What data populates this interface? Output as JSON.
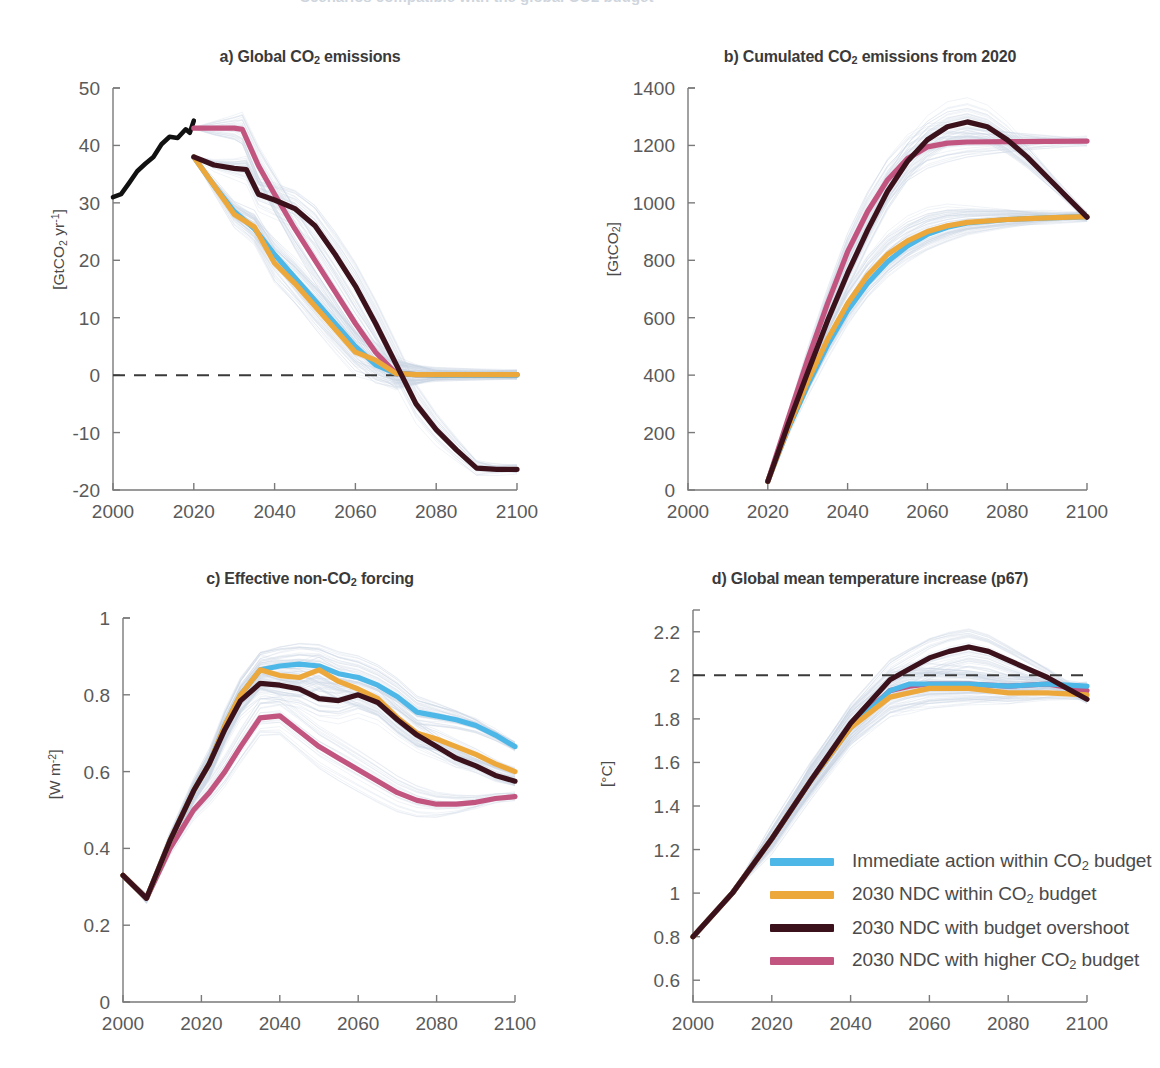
{
  "figure": {
    "background": "#ffffff",
    "cut_off_header": "Scenarios compatible with the global CO2 budget"
  },
  "colors": {
    "immediate": "#4DB7E8",
    "ndc_within": "#EDA83C",
    "ndc_overshoot": "#3B121C",
    "ndc_higher": "#C15580",
    "historical": "#111111",
    "ensemble": "#c9d4e2",
    "axis": "#7a7a7a",
    "text": "#4a4a4a"
  },
  "legend": {
    "position": "inside panel d, lower right",
    "entries": [
      {
        "label": "Immediate action within CO2 budget",
        "label_html": "Immediate action within CO<sub>2</sub> budget",
        "color_key": "immediate"
      },
      {
        "label": "2030 NDC within CO2 budget",
        "label_html": "2030 NDC within CO<sub>2</sub> budget",
        "color_key": "ndc_within"
      },
      {
        "label": "2030 NDC with budget overshoot",
        "label_html": "2030 NDC with budget overshoot",
        "color_key": "ndc_overshoot"
      },
      {
        "label": "2030 NDC with higher CO2 budget",
        "label_html": "2030 NDC with higher CO<sub>2</sub> budget",
        "color_key": "ndc_higher"
      }
    ]
  },
  "chart_data": [
    {
      "id": "a",
      "type": "line",
      "title": "a) Global CO2 emissions",
      "title_html": "a) Global CO<sub>2</sub> emissions",
      "xlabel": "",
      "ylabel": "[GtCO2 yr-1]",
      "ylabel_html": "[GtCO<sub>2</sub> yr<sup>-1</sup>]",
      "xlim": [
        2000,
        2100
      ],
      "ylim": [
        -20,
        50
      ],
      "xticks": [
        2000,
        2020,
        2040,
        2060,
        2080,
        2100
      ],
      "yticks": [
        -20,
        -10,
        0,
        10,
        20,
        30,
        40,
        50
      ],
      "grid": false,
      "hline": 0,
      "hline_style": "dashed",
      "historical": {
        "name": "Historical emissions",
        "x": [
          2000,
          2002,
          2004,
          2006,
          2008,
          2010,
          2012,
          2014,
          2016,
          2018,
          2019,
          2020
        ],
        "y": [
          31.0,
          31.5,
          33.5,
          35.5,
          36.8,
          38.0,
          40.2,
          41.5,
          41.3,
          42.8,
          42.2,
          44.3
        ]
      },
      "series": [
        {
          "name": "Immediate action within CO2 budget",
          "color_key": "immediate",
          "x": [
            2020,
            2025,
            2030,
            2035,
            2040,
            2045,
            2050,
            2055,
            2060,
            2065,
            2070,
            2075,
            2080,
            2100
          ],
          "y": [
            38.0,
            33.0,
            28.5,
            25.5,
            21.0,
            17.0,
            13.0,
            9.0,
            5.0,
            1.8,
            0.3,
            0.1,
            0.0,
            0.0
          ]
        },
        {
          "name": "2030 NDC within CO2 budget",
          "color_key": "ndc_within",
          "x": [
            2020,
            2025,
            2030,
            2035,
            2040,
            2045,
            2050,
            2055,
            2060,
            2065,
            2070,
            2075,
            2080,
            2100
          ],
          "y": [
            38.0,
            33.0,
            28.0,
            25.8,
            19.5,
            16.0,
            12.0,
            8.0,
            4.0,
            2.6,
            0.3,
            0.1,
            0.1,
            0.1
          ]
        },
        {
          "name": "2030 NDC with budget overshoot",
          "color_key": "ndc_overshoot",
          "x": [
            2020,
            2025,
            2030,
            2033,
            2036,
            2040,
            2045,
            2050,
            2055,
            2060,
            2065,
            2070,
            2075,
            2080,
            2085,
            2090,
            2095,
            2100
          ],
          "y": [
            38.0,
            36.6,
            36.0,
            35.8,
            31.5,
            30.5,
            29.0,
            26.0,
            21.0,
            15.5,
            9.0,
            2.0,
            -5.0,
            -9.5,
            -13.0,
            -16.2,
            -16.4,
            -16.4
          ]
        },
        {
          "name": "2030 NDC with higher CO2 budget",
          "color_key": "ndc_higher",
          "x": [
            2020,
            2025,
            2030,
            2032,
            2036,
            2040,
            2045,
            2050,
            2055,
            2060,
            2065,
            2070,
            2075,
            2080,
            2100
          ],
          "y": [
            43.0,
            43.0,
            43.0,
            42.8,
            36.5,
            31.5,
            25.5,
            20.0,
            14.5,
            9.0,
            4.0,
            0.3,
            0.1,
            0.1,
            0.1
          ]
        }
      ]
    },
    {
      "id": "b",
      "type": "line",
      "title": "b) Cumulated CO2 emissions from 2020",
      "title_html": "b) Cumulated CO<sub>2</sub> emissions from 2020",
      "xlabel": "",
      "ylabel": "[GtCO2]",
      "ylabel_html": "[GtCO<sub>2</sub>]",
      "xlim": [
        2000,
        2100
      ],
      "ylim": [
        0,
        1400
      ],
      "xticks": [
        2000,
        2020,
        2040,
        2060,
        2080,
        2100
      ],
      "yticks": [
        0,
        200,
        400,
        600,
        800,
        1000,
        1200,
        1400
      ],
      "grid": false,
      "series": [
        {
          "name": "Immediate action within CO2 budget",
          "color_key": "immediate",
          "x": [
            2020,
            2025,
            2030,
            2035,
            2040,
            2045,
            2050,
            2055,
            2060,
            2065,
            2070,
            2080,
            2090,
            2100
          ],
          "y": [
            30,
            210,
            365,
            505,
            625,
            720,
            795,
            850,
            890,
            915,
            930,
            942,
            948,
            952
          ]
        },
        {
          "name": "2030 NDC within CO2 budget",
          "color_key": "ndc_within",
          "x": [
            2020,
            2025,
            2030,
            2035,
            2040,
            2045,
            2050,
            2055,
            2060,
            2065,
            2070,
            2080,
            2090,
            2100
          ],
          "y": [
            30,
            215,
            380,
            525,
            650,
            748,
            820,
            868,
            900,
            920,
            932,
            942,
            948,
            952
          ]
        },
        {
          "name": "2030 NDC with budget overshoot",
          "color_key": "ndc_overshoot",
          "x": [
            2020,
            2025,
            2030,
            2035,
            2040,
            2045,
            2050,
            2055,
            2060,
            2065,
            2070,
            2075,
            2080,
            2085,
            2090,
            2095,
            2100
          ],
          "y": [
            30,
            225,
            410,
            590,
            755,
            905,
            1040,
            1145,
            1220,
            1265,
            1282,
            1265,
            1220,
            1160,
            1090,
            1020,
            950
          ]
        },
        {
          "name": "2030 NDC with higher CO2 budget",
          "color_key": "ndc_higher",
          "x": [
            2020,
            2025,
            2030,
            2035,
            2040,
            2045,
            2050,
            2055,
            2060,
            2065,
            2070,
            2080,
            2090,
            2100
          ],
          "y": [
            30,
            245,
            455,
            650,
            830,
            970,
            1080,
            1155,
            1195,
            1208,
            1212,
            1213,
            1214,
            1215
          ]
        }
      ]
    },
    {
      "id": "c",
      "type": "line",
      "title": "c) Effective non-CO2 forcing",
      "title_html": "c) Effective non-CO<sub>2</sub> forcing",
      "xlabel": "",
      "ylabel": "[W m-2]",
      "ylabel_html": "[W m<sup>-2</sup>]",
      "xlim": [
        2000,
        2100
      ],
      "ylim": [
        0,
        1
      ],
      "xticks": [
        2000,
        2020,
        2040,
        2060,
        2080,
        2100
      ],
      "yticks": [
        0,
        0.2,
        0.4,
        0.6,
        0.8,
        1
      ],
      "grid": false,
      "series": [
        {
          "name": "Immediate action within CO2 budget",
          "color_key": "immediate",
          "x": [
            2000,
            2006,
            2012,
            2018,
            2022,
            2026,
            2030,
            2035,
            2040,
            2045,
            2050,
            2055,
            2060,
            2065,
            2070,
            2075,
            2080,
            2085,
            2090,
            2095,
            2100
          ],
          "y": [
            0.33,
            0.27,
            0.42,
            0.55,
            0.62,
            0.72,
            0.8,
            0.865,
            0.875,
            0.88,
            0.875,
            0.855,
            0.845,
            0.825,
            0.795,
            0.755,
            0.745,
            0.735,
            0.72,
            0.695,
            0.665
          ]
        },
        {
          "name": "2030 NDC within CO2 budget",
          "color_key": "ndc_within",
          "x": [
            2000,
            2006,
            2012,
            2018,
            2022,
            2026,
            2030,
            2035,
            2040,
            2045,
            2050,
            2055,
            2060,
            2065,
            2070,
            2075,
            2080,
            2085,
            2090,
            2095,
            2100
          ],
          "y": [
            0.33,
            0.27,
            0.42,
            0.55,
            0.62,
            0.72,
            0.8,
            0.865,
            0.85,
            0.845,
            0.865,
            0.835,
            0.815,
            0.79,
            0.74,
            0.7,
            0.685,
            0.665,
            0.645,
            0.62,
            0.6
          ]
        },
        {
          "name": "2030 NDC with budget overshoot",
          "color_key": "ndc_overshoot",
          "x": [
            2000,
            2006,
            2012,
            2018,
            2022,
            2026,
            2030,
            2035,
            2040,
            2045,
            2050,
            2055,
            2060,
            2065,
            2070,
            2075,
            2080,
            2085,
            2090,
            2095,
            2100
          ],
          "y": [
            0.33,
            0.27,
            0.42,
            0.55,
            0.62,
            0.71,
            0.785,
            0.83,
            0.825,
            0.815,
            0.79,
            0.785,
            0.8,
            0.78,
            0.735,
            0.695,
            0.665,
            0.635,
            0.615,
            0.59,
            0.575
          ]
        },
        {
          "name": "2030 NDC with higher CO2 budget",
          "color_key": "ndc_higher",
          "x": [
            2000,
            2006,
            2012,
            2018,
            2022,
            2026,
            2030,
            2035,
            2040,
            2045,
            2050,
            2055,
            2060,
            2065,
            2070,
            2075,
            2080,
            2085,
            2090,
            2095,
            2100
          ],
          "y": [
            0.33,
            0.27,
            0.4,
            0.5,
            0.545,
            0.6,
            0.665,
            0.74,
            0.745,
            0.705,
            0.665,
            0.635,
            0.605,
            0.575,
            0.545,
            0.525,
            0.515,
            0.515,
            0.52,
            0.53,
            0.535
          ]
        }
      ]
    },
    {
      "id": "d",
      "type": "line",
      "title": "d) Global mean temperature increase (p67)",
      "title_html": "d) Global mean temperature increase (p67)",
      "xlabel": "",
      "ylabel": "[°C]",
      "ylabel_html": "[°C]",
      "xlim": [
        2000,
        2100
      ],
      "ylim": [
        0.5,
        2.3
      ],
      "xticks": [
        2000,
        2020,
        2040,
        2060,
        2080,
        2100
      ],
      "yticks": [
        0.6,
        0.8,
        1,
        1.2,
        1.4,
        1.6,
        1.8,
        2,
        2.2
      ],
      "grid": false,
      "hline": 2,
      "hline_style": "dashed",
      "series": [
        {
          "name": "Immediate action within CO2 budget",
          "color_key": "immediate",
          "x": [
            2000,
            2010,
            2020,
            2030,
            2040,
            2050,
            2055,
            2060,
            2070,
            2080,
            2090,
            2100
          ],
          "y": [
            0.8,
            1.0,
            1.25,
            1.52,
            1.76,
            1.93,
            1.96,
            1.96,
            1.96,
            1.95,
            1.96,
            1.95
          ]
        },
        {
          "name": "2030 NDC within CO2 budget",
          "color_key": "ndc_within",
          "x": [
            2000,
            2010,
            2020,
            2030,
            2040,
            2050,
            2055,
            2060,
            2070,
            2080,
            2090,
            2100
          ],
          "y": [
            0.8,
            1.0,
            1.25,
            1.52,
            1.76,
            1.9,
            1.92,
            1.94,
            1.94,
            1.92,
            1.92,
            1.91
          ]
        },
        {
          "name": "2030 NDC with budget overshoot",
          "color_key": "ndc_overshoot",
          "x": [
            2000,
            2010,
            2020,
            2030,
            2040,
            2050,
            2055,
            2060,
            2065,
            2070,
            2075,
            2080,
            2085,
            2090,
            2095,
            2100
          ],
          "y": [
            0.8,
            1.0,
            1.25,
            1.52,
            1.78,
            1.98,
            2.03,
            2.08,
            2.11,
            2.13,
            2.11,
            2.07,
            2.03,
            1.99,
            1.94,
            1.89
          ]
        },
        {
          "name": "2030 NDC with higher CO2 budget",
          "color_key": "ndc_higher",
          "x": [
            2000,
            2010,
            2020,
            2030,
            2040,
            2050,
            2055,
            2060,
            2070,
            2080,
            2090,
            2100
          ],
          "y": [
            0.8,
            1.0,
            1.25,
            1.52,
            1.77,
            1.93,
            1.95,
            1.96,
            1.96,
            1.95,
            1.96,
            1.93
          ]
        }
      ]
    }
  ]
}
